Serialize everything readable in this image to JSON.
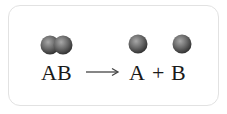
{
  "equation": {
    "reactant": "AB",
    "product_a": "A",
    "plus": "+",
    "product_b": "B"
  },
  "colors": {
    "sphere_light": "#9a9a9a",
    "sphere_dark": "#3a3a3a",
    "frame_border": "#e2e2e2",
    "text": "#1a1a1a"
  }
}
